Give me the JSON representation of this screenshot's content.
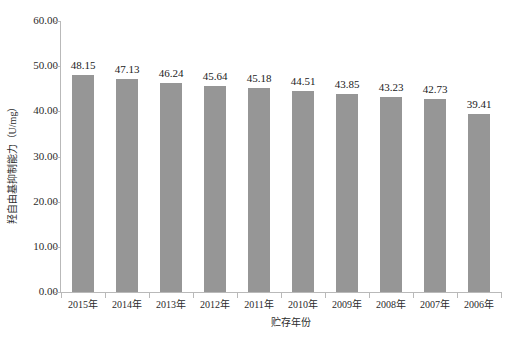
{
  "chart_data": {
    "type": "bar",
    "title": "",
    "subtitle": "",
    "xlabel": "贮存年份",
    "ylabel": "羟自由基抑制能力（U/mg）",
    "categories": [
      "2015年",
      "2014年",
      "2013年",
      "2012年",
      "2011年",
      "2010年",
      "2009年",
      "2008年",
      "2007年",
      "2006年"
    ],
    "values": [
      48.15,
      47.13,
      46.24,
      45.64,
      45.18,
      44.51,
      43.85,
      43.23,
      42.73,
      39.41
    ],
    "data_labels": [
      "48.15",
      "47.13",
      "46.24",
      "45.64",
      "45.18",
      "44.51",
      "43.85",
      "43.23",
      "42.73",
      "39.41"
    ],
    "ylim": [
      0,
      60
    ],
    "ytick_values": [
      0,
      10,
      20,
      30,
      40,
      50,
      60
    ],
    "ytick_labels": [
      "0.00",
      "10.00",
      "20.00",
      "30.00",
      "40.00",
      "50.00",
      "60.00"
    ],
    "grid": false,
    "legend": false,
    "legend_position": "none",
    "series": [
      {
        "name": "羟自由基抑制能力",
        "values": [
          48.15,
          47.13,
          46.24,
          45.64,
          45.18,
          44.51,
          43.85,
          43.23,
          42.73,
          39.41
        ],
        "color": "#969696"
      }
    ],
    "colors": {
      "bar": "#969696",
      "axis": "#b9b9b9",
      "text": "#1a1a1a",
      "background": "#ffffff"
    }
  }
}
